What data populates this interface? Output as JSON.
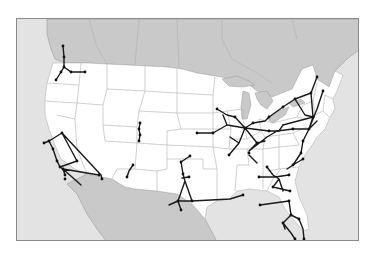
{
  "map": {
    "title": "",
    "colors": {
      "ocean_background": "#e3e3e3",
      "foreign_land": "#c9c9c9",
      "us_land": "#ffffff",
      "state_borders": "#b5b5b5",
      "routes": "#1a1a1a",
      "frame_border": "#8a8a8a"
    },
    "regions": [
      "Canada",
      "United States",
      "Mexico",
      "Pacific Ocean",
      "Gulf of Mexico",
      "Atlantic Ocean",
      "Great Lakes"
    ],
    "networks": [
      {
        "name": "Pacific Northwest corridor",
        "area": "Washington / Oregon"
      },
      {
        "name": "California corridor",
        "area": "California / Nevada"
      },
      {
        "name": "Colorado Front Range line",
        "area": "Colorado"
      },
      {
        "name": "New Mexico line",
        "area": "New Mexico"
      },
      {
        "name": "Texas triangle",
        "area": "Texas / Oklahoma"
      },
      {
        "name": "Gulf Coast line",
        "area": "Texas / Louisiana / Mississippi"
      },
      {
        "name": "Midwest hub network",
        "area": "Illinois / Michigan / Ohio / Missouri"
      },
      {
        "name": "Northeast corridor",
        "area": "New York / New England / Mid-Atlantic"
      },
      {
        "name": "Southeast corridor",
        "area": "Virginia / Carolinas / Georgia"
      },
      {
        "name": "Florida corridor",
        "area": "Florida"
      }
    ]
  }
}
